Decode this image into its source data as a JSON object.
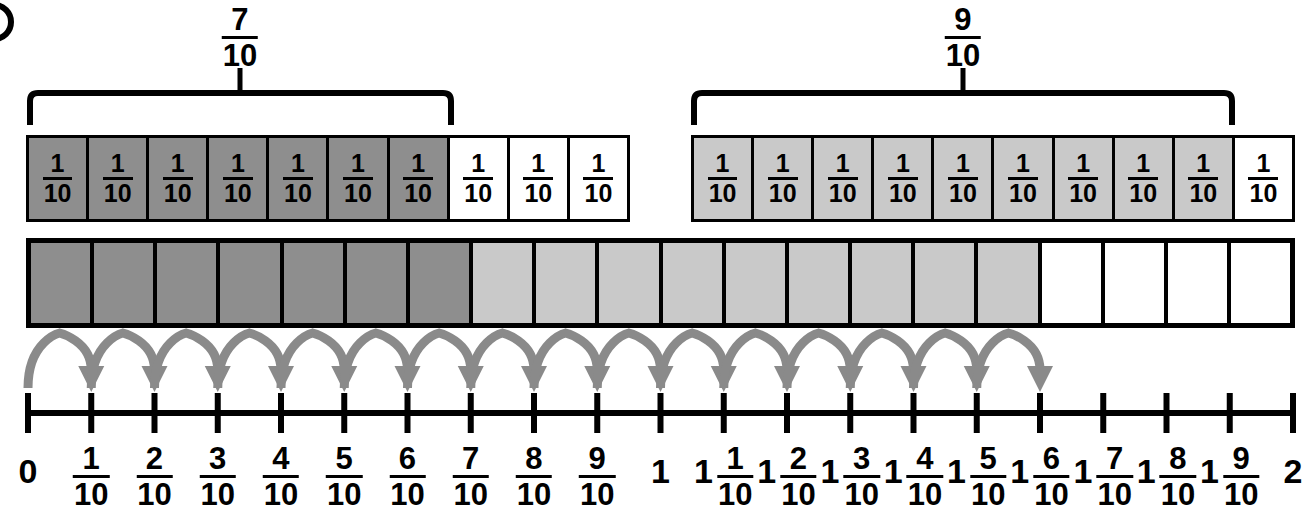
{
  "page": {
    "width": 1305,
    "height": 524,
    "background": "#ffffff"
  },
  "colors": {
    "ink": "#000000",
    "dark_fill": "#8e8e8e",
    "light_fill": "#c9c9c9",
    "blank_fill": "#ffffff",
    "arrow_gray": "#8a8a8a"
  },
  "braces": {
    "left": {
      "label_numerator": "7",
      "label_denominator": "10",
      "spans_tiles": 7
    },
    "right": {
      "label_numerator": "9",
      "label_denominator": "10",
      "spans_tiles": 9
    }
  },
  "tile_strips": [
    {
      "name": "left-strip",
      "tiles": [
        {
          "numerator": "1",
          "denominator": "10",
          "fill": "dark"
        },
        {
          "numerator": "1",
          "denominator": "10",
          "fill": "dark"
        },
        {
          "numerator": "1",
          "denominator": "10",
          "fill": "dark"
        },
        {
          "numerator": "1",
          "denominator": "10",
          "fill": "dark"
        },
        {
          "numerator": "1",
          "denominator": "10",
          "fill": "dark"
        },
        {
          "numerator": "1",
          "denominator": "10",
          "fill": "dark"
        },
        {
          "numerator": "1",
          "denominator": "10",
          "fill": "dark"
        },
        {
          "numerator": "1",
          "denominator": "10",
          "fill": "blank"
        },
        {
          "numerator": "1",
          "denominator": "10",
          "fill": "blank"
        },
        {
          "numerator": "1",
          "denominator": "10",
          "fill": "blank"
        }
      ]
    },
    {
      "name": "right-strip",
      "tiles": [
        {
          "numerator": "1",
          "denominator": "10",
          "fill": "light"
        },
        {
          "numerator": "1",
          "denominator": "10",
          "fill": "light"
        },
        {
          "numerator": "1",
          "denominator": "10",
          "fill": "light"
        },
        {
          "numerator": "1",
          "denominator": "10",
          "fill": "light"
        },
        {
          "numerator": "1",
          "denominator": "10",
          "fill": "light"
        },
        {
          "numerator": "1",
          "denominator": "10",
          "fill": "light"
        },
        {
          "numerator": "1",
          "denominator": "10",
          "fill": "light"
        },
        {
          "numerator": "1",
          "denominator": "10",
          "fill": "light"
        },
        {
          "numerator": "1",
          "denominator": "10",
          "fill": "light"
        },
        {
          "numerator": "1",
          "denominator": "10",
          "fill": "blank"
        }
      ]
    }
  ],
  "model_bar": {
    "total_cells": 20,
    "fills": [
      "dark",
      "dark",
      "dark",
      "dark",
      "dark",
      "dark",
      "dark",
      "light",
      "light",
      "light",
      "light",
      "light",
      "light",
      "light",
      "light",
      "light",
      "blank",
      "blank",
      "blank",
      "blank"
    ]
  },
  "hops": {
    "count": 16,
    "from_tick": 0,
    "to_tick": 16
  },
  "number_line": {
    "tick_count": 21,
    "start_value": "0",
    "end_value": "2",
    "labels": [
      {
        "whole": "",
        "numerator": "",
        "denominator": "",
        "plain": "0"
      },
      {
        "whole": "",
        "numerator": "1",
        "denominator": "10",
        "plain": ""
      },
      {
        "whole": "",
        "numerator": "2",
        "denominator": "10",
        "plain": ""
      },
      {
        "whole": "",
        "numerator": "3",
        "denominator": "10",
        "plain": ""
      },
      {
        "whole": "",
        "numerator": "4",
        "denominator": "10",
        "plain": ""
      },
      {
        "whole": "",
        "numerator": "5",
        "denominator": "10",
        "plain": ""
      },
      {
        "whole": "",
        "numerator": "6",
        "denominator": "10",
        "plain": ""
      },
      {
        "whole": "",
        "numerator": "7",
        "denominator": "10",
        "plain": ""
      },
      {
        "whole": "",
        "numerator": "8",
        "denominator": "10",
        "plain": ""
      },
      {
        "whole": "",
        "numerator": "9",
        "denominator": "10",
        "plain": ""
      },
      {
        "whole": "",
        "numerator": "",
        "denominator": "",
        "plain": "1"
      },
      {
        "whole": "1",
        "numerator": "1",
        "denominator": "10",
        "plain": ""
      },
      {
        "whole": "1",
        "numerator": "2",
        "denominator": "10",
        "plain": ""
      },
      {
        "whole": "1",
        "numerator": "3",
        "denominator": "10",
        "plain": ""
      },
      {
        "whole": "1",
        "numerator": "4",
        "denominator": "10",
        "plain": ""
      },
      {
        "whole": "1",
        "numerator": "5",
        "denominator": "10",
        "plain": ""
      },
      {
        "whole": "1",
        "numerator": "6",
        "denominator": "10",
        "plain": ""
      },
      {
        "whole": "1",
        "numerator": "7",
        "denominator": "10",
        "plain": ""
      },
      {
        "whole": "1",
        "numerator": "8",
        "denominator": "10",
        "plain": ""
      },
      {
        "whole": "1",
        "numerator": "9",
        "denominator": "10",
        "plain": ""
      },
      {
        "whole": "",
        "numerator": "",
        "denominator": "",
        "plain": "2"
      }
    ]
  }
}
